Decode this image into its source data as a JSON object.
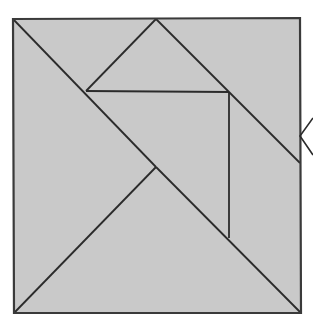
{
  "figure": {
    "canvas": {
      "width": 313,
      "height": 327,
      "background": "#ffffff"
    },
    "style": {
      "fill_color": "#c9c9c9",
      "outline_color": "#3a3a3a",
      "cut_line_color": "#2b2b2b",
      "marker_color": "#2b2b2b",
      "outline_width": 2.2,
      "cut_line_width": 1.8,
      "marker_width": 1.6
    },
    "square": {
      "name": "outer-square",
      "corners": {
        "top_left": [
          13,
          19
        ],
        "top_right": [
          300,
          18
        ],
        "bottom_right": [
          301,
          313
        ],
        "bottom_left": [
          14,
          313
        ]
      }
    },
    "vertices": {
      "top_apex": [
        156,
        19
      ],
      "left_node": [
        86,
        91
      ],
      "right_node": [
        229,
        92
      ],
      "center_cross": [
        156,
        167
      ],
      "vertical_foot": [
        229,
        238
      ],
      "right_edge_exit": [
        300,
        163
      ],
      "bottom_left_corner": [
        14,
        313
      ],
      "bottom_right_corner": [
        301,
        313
      ]
    },
    "cut_lines": [
      {
        "name": "cut-topleft-to-center",
        "from": [
          13,
          19
        ],
        "to": [
          156,
          167
        ]
      },
      {
        "name": "cut-center-to-bottomleft",
        "from": [
          156,
          167
        ],
        "to": [
          14,
          313
        ]
      },
      {
        "name": "cut-apex-to-leftnode",
        "from": [
          156,
          19
        ],
        "to": [
          86,
          91
        ]
      },
      {
        "name": "cut-apex-to-rightedge",
        "from": [
          156,
          19
        ],
        "to": [
          300,
          163
        ]
      },
      {
        "name": "cut-leftnode-to-rightnode-via-center",
        "from": [
          86,
          91
        ],
        "to": [
          229,
          92
        ]
      },
      {
        "name": "cut-center-to-bottomright",
        "from": [
          156,
          167
        ],
        "to": [
          301,
          313
        ]
      },
      {
        "name": "cut-vertical-rightnode",
        "from": [
          229,
          92
        ],
        "to": [
          229,
          238
        ]
      }
    ],
    "marker": {
      "name": "chevron-left-marker",
      "anchor_point": [
        300,
        136
      ],
      "tip": [
        300,
        136
      ],
      "upper_arm_end": [
        313,
        118
      ],
      "lower_arm_end": [
        313,
        155
      ]
    }
  }
}
